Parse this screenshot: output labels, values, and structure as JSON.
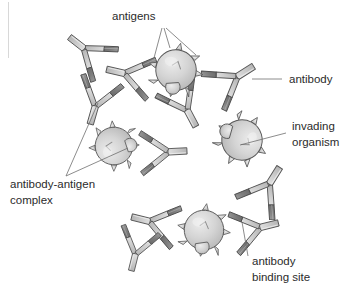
{
  "figure": {
    "type": "biology-diagram",
    "background_color": "#ffffff",
    "width": 361,
    "height": 294
  },
  "labels": {
    "antigens": "antigens",
    "antibody": "antibody",
    "invading_line1": "invading",
    "invading_line2": "organism",
    "complex_line1": "antibody-antigen",
    "complex_line2": "complex",
    "binding_line1": "antibody",
    "binding_line2": "binding site"
  },
  "colors": {
    "arm_light": "#c9c9c9",
    "arm_light_hi": "#dcdcdc",
    "binding_dark": "#767676",
    "binding_dark_2": "#8a8a8a",
    "organism_body": "#cfcfcf",
    "organism_hi": "#e2e2e2",
    "outline": "#555555",
    "leader": "#6f6f6f",
    "text": "#2b2b2b"
  },
  "organisms": [
    {
      "name": "organism-top",
      "cx": 176,
      "cy": 70,
      "r": 24,
      "spikes": 7
    },
    {
      "name": "organism-left",
      "cx": 116,
      "cy": 144,
      "r": 22,
      "spikes": 7
    },
    {
      "name": "organism-right",
      "cx": 240,
      "cy": 140,
      "r": 24,
      "spikes": 7
    },
    {
      "name": "organism-bottom",
      "cx": 204,
      "cy": 228,
      "r": 23,
      "spikes": 7
    }
  ],
  "antibodies": [
    {
      "name": "antibody-top-left",
      "x": 120,
      "y": 62,
      "rot": 8
    },
    {
      "name": "antibody-top-right",
      "x": 232,
      "y": 60,
      "rot": -22
    },
    {
      "name": "antibody-upper-left",
      "x": 84,
      "y": 52,
      "rot": 42
    },
    {
      "name": "antibody-mid-left",
      "x": 96,
      "y": 108,
      "rot": -62
    },
    {
      "name": "antibody-mid-center",
      "x": 168,
      "y": 106,
      "rot": 160
    },
    {
      "name": "antibody-mid-right",
      "x": 166,
      "y": 150,
      "rot": 4
    },
    {
      "name": "antibody-right-lower",
      "x": 266,
      "y": 178,
      "rot": -128
    },
    {
      "name": "antibody-bottom-left",
      "x": 150,
      "y": 216,
      "rot": 16
    },
    {
      "name": "antibody-bottom-right",
      "x": 250,
      "y": 222,
      "rot": 186
    },
    {
      "name": "antibody-free",
      "x": 128,
      "y": 248,
      "rot": 24
    }
  ],
  "leader_lines": [
    {
      "name": "leader-antigens-a",
      "from": "antigens",
      "to": "organism-top-spike-1"
    },
    {
      "name": "leader-antigens-b",
      "from": "antigens",
      "to": "organism-top-spike-2"
    },
    {
      "name": "leader-antigens-c",
      "from": "antigens",
      "to": "organism-top-spike-3"
    },
    {
      "name": "leader-antibody",
      "from": "antibody",
      "to": "antibody-top-right"
    },
    {
      "name": "leader-invading",
      "from": "invading organism",
      "to": "organism-right"
    },
    {
      "name": "leader-complex-a",
      "from": "antibody-antigen complex",
      "to": "antibody-mid-left"
    },
    {
      "name": "leader-complex-b",
      "from": "antibody-antigen complex",
      "to": "organism-left"
    },
    {
      "name": "leader-binding",
      "from": "antibody binding site",
      "to": "antibody-bottom-right-tip"
    }
  ]
}
